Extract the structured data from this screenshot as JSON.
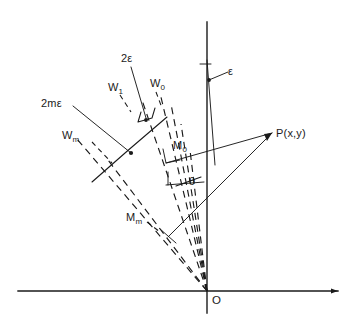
{
  "figure": {
    "axes": {
      "x_label": "x",
      "y_label": "y",
      "origin_label": "O"
    },
    "labels": {
      "two_epsilon": "2ε",
      "two_m_epsilon": "2mε",
      "epsilon": "ε",
      "theta": "θ",
      "point_p": "P(x,y)",
      "w0": "W",
      "w0_sub": "0",
      "w1": "W",
      "w1_sub": "1",
      "wm": "W",
      "wm_sub": "m",
      "m0": "M",
      "m0_sub": "0",
      "mm": "M",
      "mm_sub": "m"
    },
    "colors": {
      "ink": "#1a1a1a",
      "background": "#ffffff"
    },
    "geometry": {
      "origin": {
        "x": 207,
        "y": 291
      },
      "point_p": {
        "x": 272,
        "y": 133
      },
      "x_axis": {
        "x1": 18,
        "y1": 291,
        "x2": 338,
        "y2": 291
      },
      "y_axis": {
        "x1": 207,
        "y1": 22,
        "x2": 207,
        "y2": 313
      },
      "ray_count": 7,
      "ray_angles_deg_from_y": [
        4,
        8,
        13,
        19,
        26,
        33,
        41
      ]
    }
  }
}
